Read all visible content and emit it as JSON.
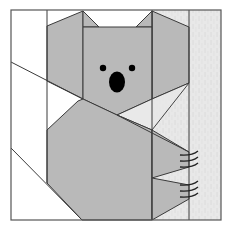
{
  "diagram": {
    "title": "Koala quilt block pattern",
    "canvas": {
      "width": 231,
      "height": 228
    },
    "colors": {
      "background": "#ffffff",
      "koala_fill": "#b9b9b9",
      "trunk_fill": "#e8e8e8",
      "trunk_texture": "#d6d6d6",
      "outline": "#3a3a3a",
      "features": "#000000",
      "border": "#555555"
    },
    "border": {
      "x": 11,
      "y": 10,
      "width": 210,
      "height": 210
    },
    "features": {
      "left_eye": {
        "cx": 103,
        "cy": 68,
        "r": 3.2
      },
      "right_eye": {
        "cx": 132,
        "cy": 68,
        "r": 3.2
      },
      "nose": {
        "cx": 117,
        "cy": 82,
        "rx": 8,
        "ry": 10.5
      }
    },
    "claws": {
      "upper": [
        155,
        161,
        167
      ],
      "lower": [
        185,
        191,
        197
      ],
      "x_start": 180,
      "x_end": 198
    }
  }
}
